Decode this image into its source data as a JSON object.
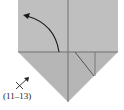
{
  "diagram": {
    "type": "origami-step",
    "colors": {
      "paper": "#bdbdbd",
      "paper_lower": "#b4b4b4",
      "crease": "#5a5a5a",
      "arrow": "#1a1a1a",
      "background": "#ffffff"
    },
    "annotation": {
      "symbol": "turn-over-x-arrow",
      "label": "(11–13)"
    },
    "arrow": {
      "kind": "fold-arrow",
      "direction": "up-left"
    }
  }
}
